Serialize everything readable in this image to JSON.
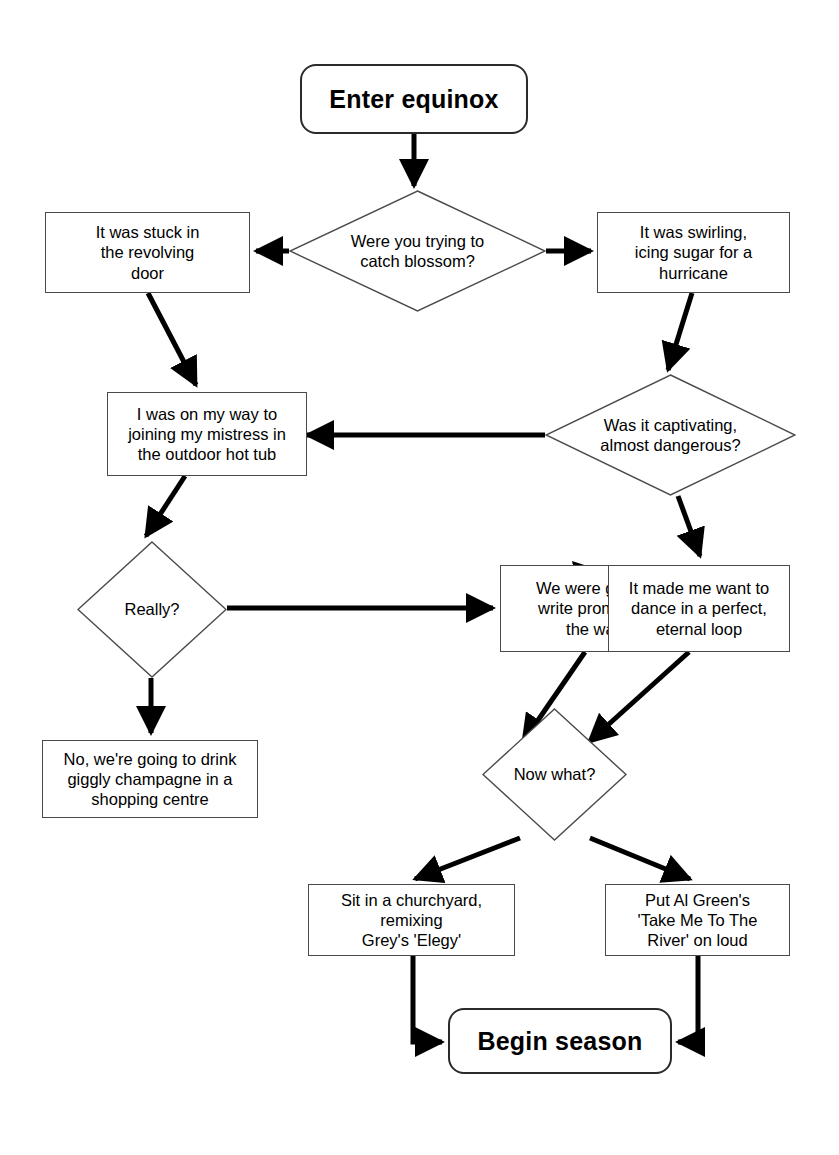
{
  "diagram": {
    "type": "flowchart",
    "background_color": "#ffffff",
    "stroke_color": "#000000",
    "node_border_color": "#4a4a4a",
    "terminal_border_color": "#2b2b2b",
    "nodes": [
      {
        "id": "start",
        "shape": "terminal",
        "label": "Enter equinox"
      },
      {
        "id": "d1",
        "shape": "decision",
        "label": "Were you trying to\ncatch blossom?"
      },
      {
        "id": "revolving",
        "shape": "process",
        "label": "It was stuck in\nthe revolving\ndoor"
      },
      {
        "id": "swirling",
        "shape": "process",
        "label": "It was swirling,\nicing sugar for a\nhurricane"
      },
      {
        "id": "hottub",
        "shape": "process",
        "label": "I was on my way to\njoining my mistress in\nthe outdoor hot tub"
      },
      {
        "id": "d2",
        "shape": "decision",
        "label": "Was it captivating,\nalmost dangerous?"
      },
      {
        "id": "d3",
        "shape": "decision",
        "label": "Really?"
      },
      {
        "id": "promises",
        "shape": "process",
        "label": "We were going to\nwrite promises in\nthe water"
      },
      {
        "id": "dance",
        "shape": "process",
        "label": "It made me want to\ndance in a perfect,\neternal loop"
      },
      {
        "id": "champagne",
        "shape": "process",
        "label": "No, we're going to drink\ngiggly champagne in a\nshopping centre"
      },
      {
        "id": "d4",
        "shape": "decision",
        "label": "Now what?"
      },
      {
        "id": "churchyard",
        "shape": "process",
        "label": "Sit in a churchyard,\nremixing\nGrey's 'Elegy'"
      },
      {
        "id": "algreen",
        "shape": "process",
        "label": "Put Al Green's\n'Take Me To The\nRiver' on loud"
      },
      {
        "id": "end",
        "shape": "terminal",
        "label": "Begin season"
      }
    ],
    "edges": [
      {
        "from": "start",
        "to": "d1",
        "style": "straight"
      },
      {
        "from": "d1",
        "to": "revolving",
        "style": "straight"
      },
      {
        "from": "d1",
        "to": "swirling",
        "style": "straight"
      },
      {
        "from": "revolving",
        "to": "hottub",
        "style": "straight"
      },
      {
        "from": "swirling",
        "to": "d2",
        "style": "straight"
      },
      {
        "from": "d2",
        "to": "hottub",
        "style": "straight"
      },
      {
        "from": "d2",
        "to": "dance",
        "style": "straight"
      },
      {
        "from": "hottub",
        "to": "d3",
        "style": "straight"
      },
      {
        "from": "d3",
        "to": "promises",
        "style": "straight"
      },
      {
        "from": "d3",
        "to": "champagne",
        "style": "straight"
      },
      {
        "from": "promises",
        "to": "dance",
        "style": "curved"
      },
      {
        "from": "promises",
        "to": "d4",
        "style": "straight"
      },
      {
        "from": "dance",
        "to": "d4",
        "style": "straight"
      },
      {
        "from": "d4",
        "to": "churchyard",
        "style": "straight"
      },
      {
        "from": "d4",
        "to": "algreen",
        "style": "straight"
      },
      {
        "from": "churchyard",
        "to": "end",
        "style": "elbow"
      },
      {
        "from": "algreen",
        "to": "end",
        "style": "elbow"
      }
    ]
  }
}
